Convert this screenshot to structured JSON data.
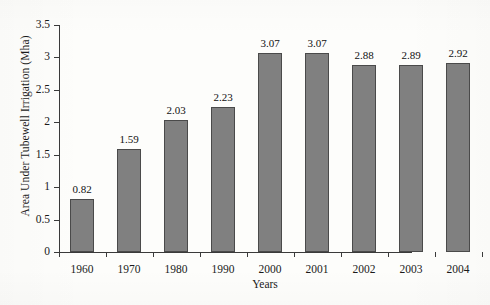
{
  "chart_data": {
    "type": "bar",
    "title": "",
    "xlabel": "Years",
    "ylabel": "Area Under Tubewell Irrigation (Mha)",
    "categories": [
      "1960",
      "1970",
      "1980",
      "1990",
      "2000",
      "2001",
      "2002",
      "2003",
      "2004"
    ],
    "values": [
      0.82,
      1.59,
      2.03,
      2.23,
      3.07,
      3.07,
      2.88,
      2.89,
      2.92
    ],
    "value_labels": [
      "0.82",
      "1.59",
      "2.03",
      "2.23",
      "3.07",
      "3.07",
      "2.88",
      "2.89",
      "2.92"
    ],
    "ylim": [
      0,
      3.5
    ],
    "ytick_values": [
      0,
      0.5,
      1,
      1.5,
      2,
      2.5,
      3,
      3.5
    ],
    "ytick_labels": [
      "0",
      "0.5",
      "1",
      "1.5",
      "2",
      "2.5",
      "3",
      "3.5"
    ],
    "grid": false,
    "legend": false,
    "legend_position": "none",
    "bar_color": "#808080",
    "bar_edge_color": "#4a4a4a",
    "axis_color": "#3a3a3a",
    "background_color": "#fdfdfb"
  }
}
